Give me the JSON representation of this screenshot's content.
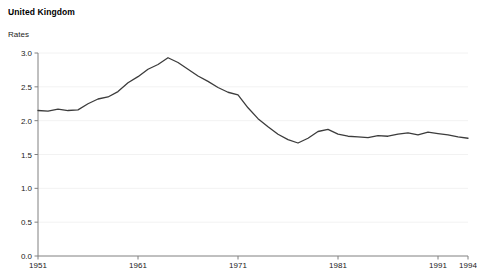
{
  "title": "United Kingdom",
  "ylabel": "Rates",
  "axis": {
    "y_ticks": [
      "0.0",
      "0.5",
      "1.0",
      "1.5",
      "2.0",
      "2.5",
      "3.0"
    ],
    "x_ticks": [
      "1951",
      "1961",
      "1971",
      "1981",
      "1991",
      "1994"
    ]
  },
  "style": {
    "line_color": "#3c3c3c",
    "axis_color": "#808080",
    "grid_color": "#f2f2f2",
    "background": "#ffffff"
  },
  "chart_data": {
    "type": "line",
    "title": "United Kingdom",
    "xlabel": "",
    "ylabel": "Rates",
    "xlim": [
      1951,
      1994
    ],
    "ylim": [
      0.0,
      3.0
    ],
    "grid": true,
    "legend": "none",
    "x_tick_values": [
      1951,
      1961,
      1971,
      1981,
      1991,
      1994
    ],
    "y_tick_values": [
      0.0,
      0.5,
      1.0,
      1.5,
      2.0,
      2.5,
      3.0
    ],
    "x": [
      1951,
      1952,
      1953,
      1954,
      1955,
      1956,
      1957,
      1958,
      1959,
      1960,
      1961,
      1962,
      1963,
      1964,
      1965,
      1966,
      1967,
      1968,
      1969,
      1970,
      1971,
      1972,
      1973,
      1974,
      1975,
      1976,
      1977,
      1978,
      1979,
      1980,
      1981,
      1982,
      1983,
      1984,
      1985,
      1986,
      1987,
      1988,
      1989,
      1990,
      1991,
      1992,
      1993,
      1994
    ],
    "series": [
      {
        "name": "Total fertility rate",
        "values": [
          2.15,
          2.14,
          2.17,
          2.15,
          2.16,
          2.25,
          2.32,
          2.35,
          2.43,
          2.56,
          2.65,
          2.76,
          2.83,
          2.93,
          2.86,
          2.76,
          2.66,
          2.58,
          2.49,
          2.42,
          2.38,
          2.19,
          2.03,
          1.91,
          1.8,
          1.72,
          1.67,
          1.74,
          1.84,
          1.87,
          1.8,
          1.77,
          1.76,
          1.75,
          1.78,
          1.77,
          1.8,
          1.82,
          1.79,
          1.83,
          1.81,
          1.79,
          1.76,
          1.74
        ]
      }
    ]
  }
}
